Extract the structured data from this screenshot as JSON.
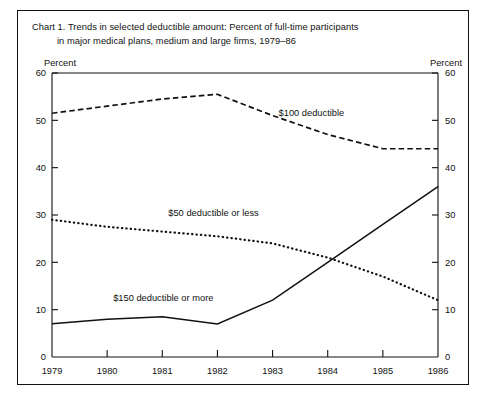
{
  "chart_title": {
    "line1": "Chart 1. Trends in selected deductible amount: Percent of full-time participants",
    "line2": "in major medical plans, medium and large firms, 1979–86"
  },
  "axis_titles": {
    "left": "Percent",
    "right": "Percent"
  },
  "chart_data": {
    "type": "line",
    "title": "Chart 1. Trends in selected deductible amount: Percent of full-time participants in major medical plans, medium and large firms, 1979–86",
    "xlabel": "",
    "ylabel": "Percent",
    "y2label": "Percent",
    "x": [
      "1979",
      "1980",
      "1981",
      "1982",
      "1983",
      "1984",
      "1985",
      "1986"
    ],
    "categories": [
      "1979",
      "1980",
      "1981",
      "1982",
      "1983",
      "1984",
      "1985",
      "1986"
    ],
    "xlim": [
      "1979",
      "1986"
    ],
    "ylim": [
      0,
      60
    ],
    "yticks": [
      0,
      10,
      20,
      30,
      40,
      50,
      60
    ],
    "y2ticks": [
      0,
      10,
      20,
      30,
      40,
      50,
      60
    ],
    "grid": false,
    "legend": "inline-annotations",
    "series": [
      {
        "name": "$100 deductible",
        "style": "dashed",
        "values": [
          51.5,
          53.0,
          54.5,
          55.5,
          51.0,
          47.0,
          44.0,
          44.0
        ]
      },
      {
        "name": "$50 deductible or less",
        "style": "dotted",
        "values": [
          29.0,
          27.5,
          26.5,
          25.5,
          24.0,
          21.0,
          17.0,
          12.0
        ]
      },
      {
        "name": "$150 deductible or more",
        "style": "solid",
        "values": [
          7.0,
          8.0,
          8.5,
          7.0,
          12.0,
          20.0,
          28.0,
          36.0
        ]
      }
    ],
    "annotations": [
      {
        "text": "$100 deductible",
        "x": "1983",
        "y": 50
      },
      {
        "text": "$50 deductible or less",
        "x": "1981",
        "y": 29
      },
      {
        "text": "$150 deductible or more",
        "x": "1980",
        "y": 11
      }
    ]
  }
}
